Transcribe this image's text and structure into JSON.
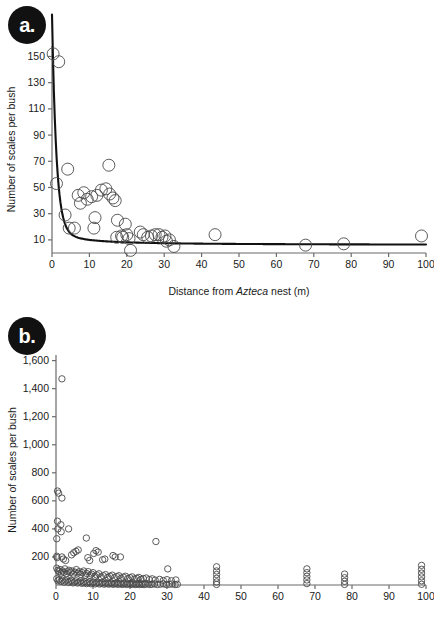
{
  "figure": {
    "title": "",
    "panels": [
      {
        "id": "a",
        "badge_label": "a.",
        "xlabel_parts": {
          "pre": "Distance from ",
          "italic": "Azteca",
          "post": " nest (m)"
        },
        "xlabel_full": "Distance from Azteca nest (m)",
        "ylabel": "Number of scales per bush"
      },
      {
        "id": "b",
        "badge_label": "b.",
        "xlabel_parts": {
          "pre": "",
          "italic": "",
          "post": ""
        },
        "xlabel_full": "",
        "ylabel": "Number of scales per bush"
      }
    ]
  },
  "chart_data": [
    {
      "type": "scatter",
      "panel": "a",
      "title": "",
      "xlabel": "Distance from Azteca nest (m)",
      "ylabel": "Number of scales per bush",
      "xlim": [
        0,
        100
      ],
      "ylim": [
        0,
        158
      ],
      "xticks": [
        0,
        10,
        20,
        30,
        40,
        50,
        60,
        70,
        80,
        90,
        100
      ],
      "xticklabels": [
        "0",
        "10",
        "20",
        "30",
        "40",
        "50",
        "60",
        "70",
        "80",
        "90",
        "100"
      ],
      "yticks": [
        10,
        30,
        50,
        70,
        90,
        110,
        130,
        150
      ],
      "yticklabels": [
        "10",
        "30",
        "50",
        "70",
        "90",
        "110",
        "130",
        "150"
      ],
      "grid": false,
      "legend": null,
      "marker": "open-circle",
      "points": [
        [
          0.3,
          152
        ],
        [
          1.8,
          146
        ],
        [
          1.2,
          53
        ],
        [
          4.2,
          64
        ],
        [
          15.2,
          67
        ],
        [
          3.5,
          29
        ],
        [
          4.6,
          19
        ],
        [
          6.0,
          19
        ],
        [
          7.0,
          44
        ],
        [
          7.6,
          38
        ],
        [
          8.5,
          46
        ],
        [
          9.4,
          41
        ],
        [
          10.6,
          43
        ],
        [
          11.2,
          19
        ],
        [
          11.5,
          27
        ],
        [
          12.0,
          44
        ],
        [
          13.2,
          48
        ],
        [
          14.4,
          49
        ],
        [
          15.4,
          45
        ],
        [
          16.3,
          42
        ],
        [
          16.9,
          40
        ],
        [
          17.3,
          12
        ],
        [
          17.5,
          25
        ],
        [
          18.6,
          13
        ],
        [
          18.9,
          12
        ],
        [
          19.6,
          22
        ],
        [
          20.0,
          14
        ],
        [
          20.6,
          11
        ],
        [
          21.0,
          2
        ],
        [
          23.6,
          16
        ],
        [
          24.4,
          14
        ],
        [
          25.6,
          12
        ],
        [
          26.6,
          13
        ],
        [
          27.6,
          14
        ],
        [
          28.6,
          14
        ],
        [
          29.4,
          12
        ],
        [
          30.2,
          13
        ],
        [
          30.6,
          9
        ],
        [
          31.4,
          10
        ],
        [
          32.6,
          5
        ],
        [
          43.6,
          14
        ],
        [
          67.8,
          6
        ],
        [
          78.0,
          7
        ],
        [
          98.8,
          13
        ]
      ],
      "fit_curve": {
        "present": true,
        "style": "solid-black",
        "description": "steeply decaying power/exponential decline from ~155 at x=0 to ~6 at x=100"
      }
    },
    {
      "type": "scatter",
      "panel": "b",
      "title": "",
      "xlabel": "",
      "ylabel": "Number of scales per bush",
      "xlim": [
        0,
        100
      ],
      "ylim": [
        0,
        1640
      ],
      "xticks": [
        0,
        10,
        20,
        30,
        40,
        50,
        60,
        70,
        80,
        90,
        100
      ],
      "xticklabels": [
        "0",
        "10",
        "20",
        "30",
        "40",
        "50",
        "60",
        "70",
        "80",
        "90",
        "100"
      ],
      "yticks": [
        200,
        400,
        600,
        800,
        1000,
        1200,
        1400,
        1600
      ],
      "yticklabels": [
        "200",
        "400",
        "600",
        "800",
        "1,000",
        "1,200",
        "1,400",
        "1,600"
      ],
      "grid": false,
      "legend": null,
      "marker": "open-circle",
      "points": [
        [
          1.6,
          1470
        ],
        [
          0.4,
          670
        ],
        [
          0.7,
          655
        ],
        [
          1.6,
          620
        ],
        [
          0.4,
          455
        ],
        [
          0.5,
          400
        ],
        [
          0.2,
          330
        ],
        [
          1.3,
          430
        ],
        [
          1.4,
          380
        ],
        [
          3.4,
          400
        ],
        [
          8.2,
          335
        ],
        [
          27.0,
          310
        ],
        [
          0.2,
          205
        ],
        [
          0.3,
          195
        ],
        [
          1.6,
          200
        ],
        [
          2.0,
          185
        ],
        [
          2.6,
          175
        ],
        [
          4.2,
          215
        ],
        [
          4.8,
          230
        ],
        [
          5.4,
          240
        ],
        [
          6.0,
          250
        ],
        [
          8.6,
          195
        ],
        [
          9.1,
          175
        ],
        [
          10.2,
          225
        ],
        [
          10.8,
          245
        ],
        [
          11.4,
          235
        ],
        [
          12.6,
          180
        ],
        [
          13.2,
          185
        ],
        [
          15.4,
          210
        ],
        [
          16.0,
          200
        ],
        [
          17.4,
          200
        ],
        [
          30.2,
          115
        ],
        [
          0.2,
          120
        ],
        [
          0.5,
          105
        ],
        [
          0.8,
          95
        ],
        [
          1.1,
          110
        ],
        [
          1.4,
          85
        ],
        [
          1.8,
          100
        ],
        [
          2.1,
          90
        ],
        [
          2.4,
          115
        ],
        [
          2.8,
          80
        ],
        [
          3.1,
          95
        ],
        [
          3.5,
          105
        ],
        [
          3.9,
          88
        ],
        [
          4.3,
          100
        ],
        [
          4.7,
          78
        ],
        [
          5.1,
          92
        ],
        [
          5.5,
          110
        ],
        [
          5.9,
          85
        ],
        [
          6.3,
          95
        ],
        [
          6.7,
          75
        ],
        [
          7.1,
          88
        ],
        [
          7.5,
          100
        ],
        [
          7.9,
          70
        ],
        [
          8.3,
          82
        ],
        [
          8.7,
          95
        ],
        [
          9.2,
          68
        ],
        [
          9.6,
          78
        ],
        [
          10.0,
          88
        ],
        [
          10.5,
          62
        ],
        [
          11.0,
          72
        ],
        [
          11.6,
          80
        ],
        [
          12.2,
          58
        ],
        [
          12.8,
          66
        ],
        [
          13.4,
          74
        ],
        [
          14.0,
          55
        ],
        [
          14.6,
          62
        ],
        [
          15.2,
          70
        ],
        [
          15.8,
          52
        ],
        [
          16.4,
          60
        ],
        [
          17.0,
          66
        ],
        [
          17.6,
          48
        ],
        [
          18.2,
          56
        ],
        [
          18.8,
          62
        ],
        [
          19.4,
          45
        ],
        [
          20.0,
          52
        ],
        [
          20.6,
          58
        ],
        [
          21.2,
          42
        ],
        [
          21.8,
          48
        ],
        [
          22.4,
          54
        ],
        [
          23.0,
          40
        ],
        [
          23.6,
          46
        ],
        [
          24.4,
          50
        ],
        [
          25.2,
          38
        ],
        [
          26.0,
          44
        ],
        [
          26.8,
          35
        ],
        [
          28.0,
          40
        ],
        [
          29.0,
          32
        ],
        [
          30.0,
          38
        ],
        [
          31.2,
          30
        ],
        [
          32.4,
          36
        ],
        [
          0.2,
          45
        ],
        [
          0.5,
          30
        ],
        [
          0.9,
          38
        ],
        [
          1.3,
          25
        ],
        [
          1.7,
          34
        ],
        [
          2.2,
          20
        ],
        [
          2.6,
          28
        ],
        [
          3.0,
          36
        ],
        [
          3.4,
          18
        ],
        [
          3.8,
          26
        ],
        [
          4.2,
          32
        ],
        [
          4.6,
          15
        ],
        [
          5.0,
          22
        ],
        [
          5.4,
          30
        ],
        [
          5.8,
          14
        ],
        [
          6.2,
          20
        ],
        [
          6.6,
          28
        ],
        [
          7.0,
          12
        ],
        [
          7.4,
          18
        ],
        [
          7.8,
          25
        ],
        [
          8.2,
          10
        ],
        [
          8.6,
          16
        ],
        [
          9.0,
          22
        ],
        [
          9.4,
          9
        ],
        [
          9.8,
          14
        ],
        [
          10.2,
          20
        ],
        [
          10.6,
          8
        ],
        [
          11.0,
          13
        ],
        [
          11.4,
          18
        ],
        [
          11.8,
          7
        ],
        [
          12.2,
          12
        ],
        [
          12.6,
          17
        ],
        [
          13.0,
          6
        ],
        [
          13.4,
          11
        ],
        [
          13.8,
          15
        ],
        [
          14.2,
          6
        ],
        [
          14.6,
          10
        ],
        [
          15.0,
          14
        ],
        [
          15.4,
          5
        ],
        [
          15.8,
          9
        ],
        [
          16.2,
          13
        ],
        [
          16.6,
          5
        ],
        [
          17.0,
          8
        ],
        [
          17.4,
          12
        ],
        [
          17.8,
          4
        ],
        [
          18.2,
          8
        ],
        [
          18.6,
          11
        ],
        [
          19.0,
          4
        ],
        [
          19.4,
          7
        ],
        [
          19.8,
          10
        ],
        [
          20.2,
          4
        ],
        [
          20.6,
          7
        ],
        [
          21.0,
          10
        ],
        [
          21.4,
          3
        ],
        [
          21.8,
          6
        ],
        [
          22.2,
          9
        ],
        [
          22.6,
          3
        ],
        [
          23.0,
          6
        ],
        [
          23.4,
          9
        ],
        [
          23.8,
          3
        ],
        [
          24.2,
          6
        ],
        [
          24.8,
          8
        ],
        [
          25.4,
          3
        ],
        [
          26.0,
          6
        ],
        [
          26.6,
          8
        ],
        [
          27.4,
          3
        ],
        [
          28.2,
          6
        ],
        [
          29.0,
          8
        ],
        [
          29.8,
          3
        ],
        [
          30.6,
          5
        ],
        [
          31.4,
          7
        ],
        [
          32.2,
          3
        ],
        [
          32.8,
          5
        ],
        [
          43.4,
          130
        ],
        [
          43.4,
          100
        ],
        [
          43.4,
          75
        ],
        [
          43.4,
          48
        ],
        [
          43.4,
          22
        ],
        [
          43.4,
          4
        ],
        [
          67.8,
          115
        ],
        [
          67.8,
          88
        ],
        [
          67.8,
          62
        ],
        [
          67.8,
          36
        ],
        [
          67.8,
          10
        ],
        [
          78.0,
          78
        ],
        [
          78.0,
          52
        ],
        [
          78.0,
          26
        ],
        [
          78.0,
          4
        ],
        [
          98.8,
          140
        ],
        [
          98.8,
          112
        ],
        [
          98.8,
          85
        ],
        [
          98.8,
          58
        ],
        [
          98.8,
          30
        ],
        [
          98.8,
          5
        ]
      ],
      "fit_curve": {
        "present": false
      }
    }
  ],
  "style": {
    "axis_color": "#6b6b6b",
    "marker_stroke": "#4a4a4a",
    "curve_color": "#111111",
    "text_color": "#1a1a1a",
    "badge_bg": "#111111",
    "badge_fg": "#ffffff",
    "background": "#ffffff"
  }
}
